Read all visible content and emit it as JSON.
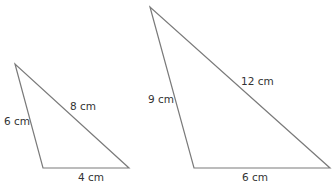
{
  "diagram": {
    "stroke_color": "#7a7a7a",
    "triangles": [
      {
        "name": "small",
        "vertices": [
          [
            15,
            64
          ],
          [
            43,
            168
          ],
          [
            129,
            168
          ]
        ],
        "labels": {
          "left": "6 cm",
          "hypotenuse": "8 cm",
          "base": "4 cm"
        }
      },
      {
        "name": "large",
        "vertices": [
          [
            150,
            7
          ],
          [
            194,
            168
          ],
          [
            330,
            168
          ]
        ],
        "labels": {
          "left": "9 cm",
          "hypotenuse": "12 cm",
          "base": "6 cm"
        }
      }
    ]
  }
}
